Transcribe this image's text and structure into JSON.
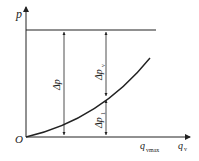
{
  "diagram": {
    "y_axis_label": "p",
    "x_axis_label": "q",
    "x_axis_sub": "v",
    "origin_label": "O",
    "qvmax_label": "q",
    "qvmax_sub": "vmax",
    "delta_p": {
      "main": "Δp",
      "sub": ""
    },
    "delta_pv": {
      "main": "Δp",
      "sub": "v"
    },
    "delta_p1": {
      "main": "Δp",
      "sub": "1"
    },
    "line_color": "#222222"
  }
}
